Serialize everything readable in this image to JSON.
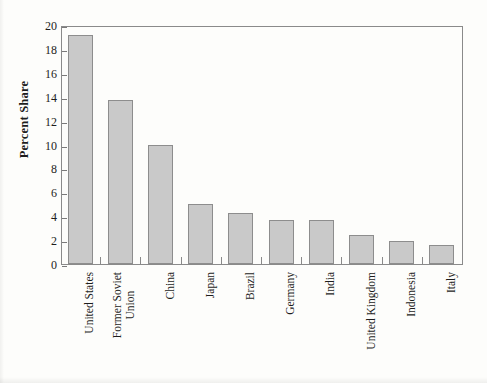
{
  "chart_data": {
    "type": "bar",
    "title": "",
    "subtitle": "",
    "xlabel": "",
    "ylabel": "Percent Share",
    "categories": [
      "United States",
      "Former Soviet Union",
      "China",
      "Japan",
      "Brazil",
      "Germany",
      "India",
      "United Kingdom",
      "Indonesia",
      "Italy"
    ],
    "category_lines": [
      [
        "United States"
      ],
      [
        "Former Soviet",
        "Union"
      ],
      [
        "China"
      ],
      [
        "Japan"
      ],
      [
        "Brazil"
      ],
      [
        "Germany"
      ],
      [
        "India"
      ],
      [
        "United Kingdom"
      ],
      [
        "Indonesia"
      ],
      [
        "Italy"
      ]
    ],
    "values": [
      19.2,
      13.7,
      10.0,
      5.0,
      4.3,
      3.7,
      3.7,
      2.4,
      1.9,
      1.6
    ],
    "ylim": [
      0,
      20
    ],
    "ytick_values": [
      0,
      2,
      4,
      6,
      8,
      10,
      12,
      14,
      16,
      18,
      20
    ],
    "ytick_labels": [
      "0",
      "2",
      "4",
      "6",
      "8",
      "10",
      "12",
      "14",
      "16",
      "18",
      "20"
    ],
    "grid": false,
    "legend": null,
    "bar_fill_color": "#c9c9c9",
    "bar_edge_color": "#8d8d8d",
    "axis_color": "#8a8a8a",
    "text_color": "#1d1d1d"
  }
}
